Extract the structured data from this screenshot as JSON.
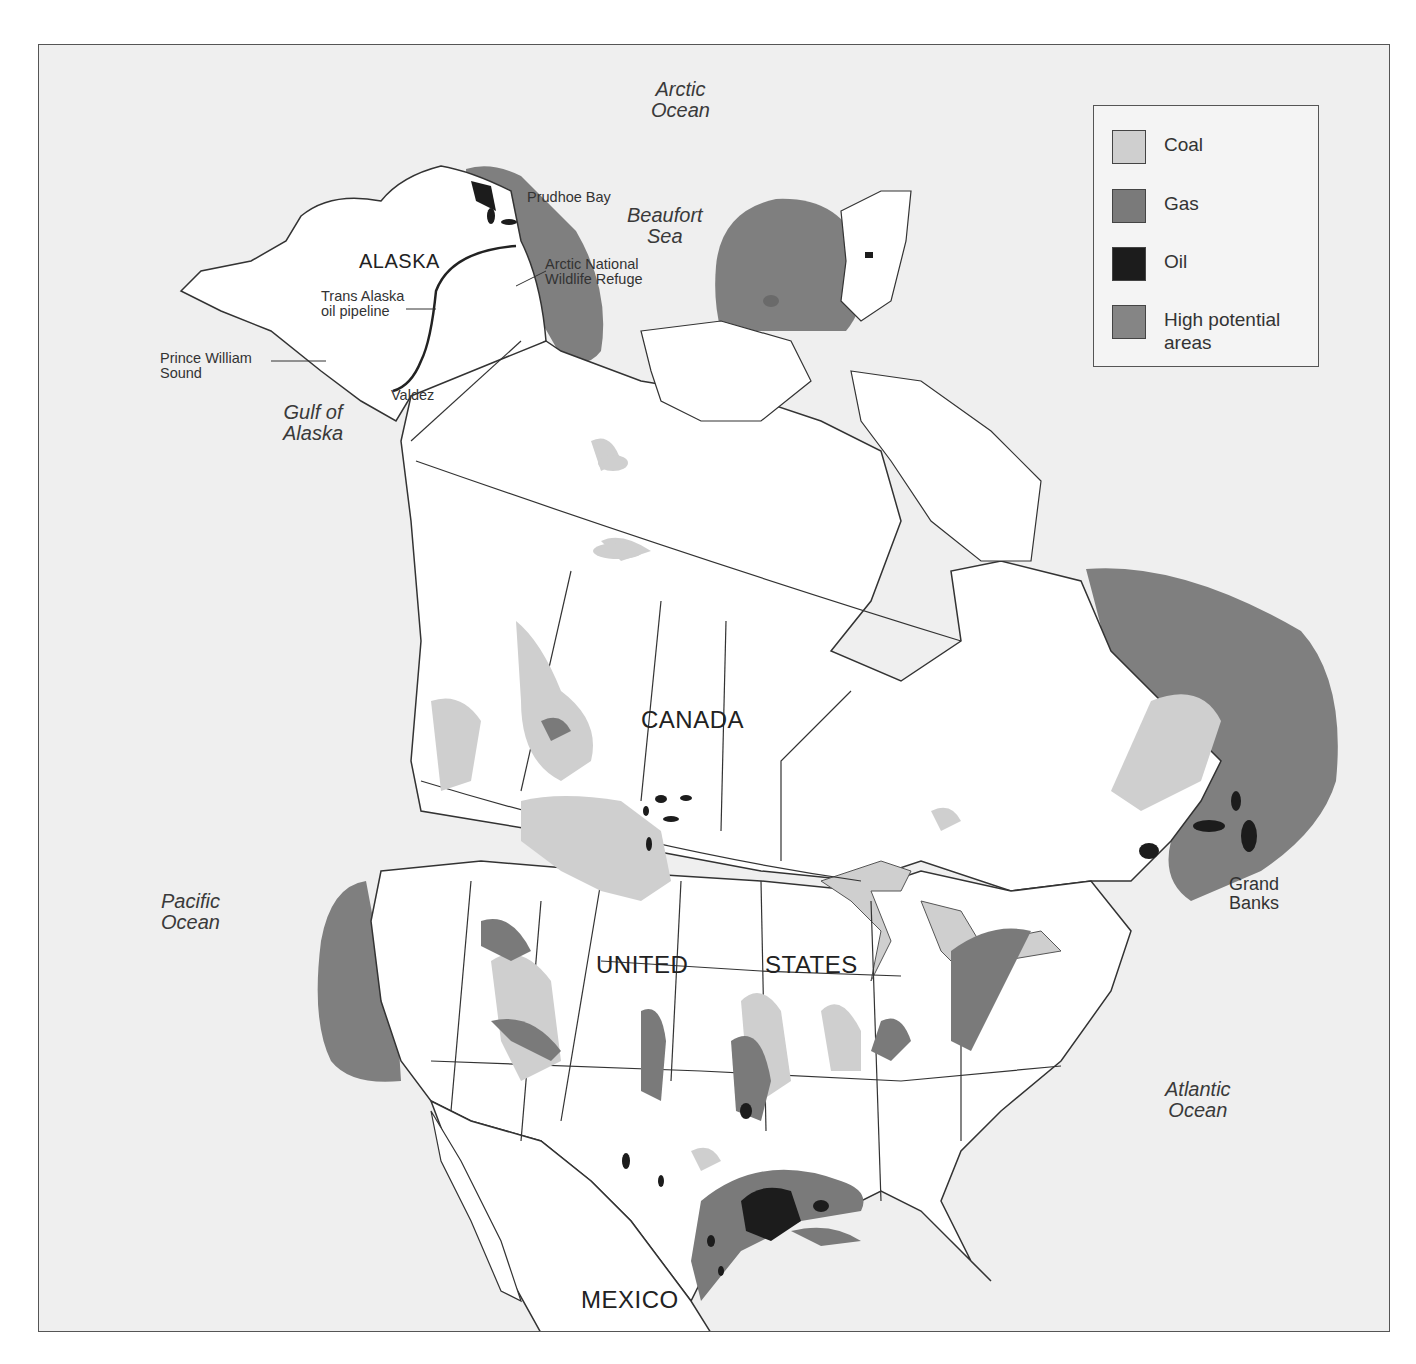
{
  "map": {
    "title": "",
    "colors": {
      "ocean": "#efefef",
      "land": "#ffffff",
      "coal": "#cfcfcf",
      "gas": "#7a7a7a",
      "oil": "#1c1c1c",
      "high_potential": "#858585",
      "border": "#333333"
    }
  },
  "legend": {
    "items": [
      {
        "label": "Coal",
        "color": "#cfcfcf"
      },
      {
        "label": "Gas",
        "color": "#7a7a7a"
      },
      {
        "label": "Oil",
        "color": "#1c1c1c"
      },
      {
        "label": "High potential areas",
        "color": "#858585"
      }
    ],
    "high_potential_line1": "High potential",
    "high_potential_line2": "areas"
  },
  "labels": {
    "oceans": {
      "arctic_1": "Arctic",
      "arctic_2": "Ocean",
      "beaufort_1": "Beaufort",
      "beaufort_2": "Sea",
      "gulf_alaska_1": "Gulf of",
      "gulf_alaska_2": "Alaska",
      "pacific_1": "Pacific",
      "pacific_2": "Ocean",
      "atlantic_1": "Atlantic",
      "atlantic_2": "Ocean"
    },
    "countries": {
      "alaska": "ALASKA",
      "canada": "CANADA",
      "united": "UNITED",
      "states": "STATES",
      "mexico": "MEXICO"
    },
    "places": {
      "prudhoe": "Prudhoe Bay",
      "anwr_1": "Arctic National",
      "anwr_2": "Wildlife Refuge",
      "pipeline_1": "Trans Alaska",
      "pipeline_2": "oil pipeline",
      "pws_1": "Prince William",
      "pws_2": "Sound",
      "valdez": "Valdez",
      "grand_1": "Grand",
      "grand_2": "Banks"
    }
  }
}
